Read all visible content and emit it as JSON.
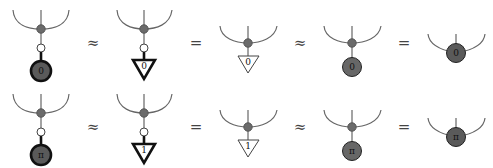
{
  "diagram": {
    "type": "zx-calculus-equations",
    "rows": [
      {
        "terms": [
          {
            "kind": "spider-with-thick-effect",
            "effect_label": "0"
          },
          {
            "kind": "spider-with-thick-triangle",
            "triangle_label": "0"
          },
          {
            "kind": "spider-with-triangle",
            "triangle_label": "0"
          },
          {
            "kind": "spider-with-dark-node",
            "node_label": "0"
          },
          {
            "kind": "fused-dark-spider",
            "node_label": "0"
          }
        ],
        "relations": [
          "≈",
          "=",
          "≈",
          "="
        ]
      },
      {
        "terms": [
          {
            "kind": "spider-with-thick-effect",
            "effect_label": "π"
          },
          {
            "kind": "spider-with-thick-triangle",
            "triangle_label": "1"
          },
          {
            "kind": "spider-with-triangle",
            "triangle_label": "1"
          },
          {
            "kind": "spider-with-dark-node",
            "node_label": "π"
          },
          {
            "kind": "fused-dark-spider",
            "node_label": "π"
          }
        ],
        "relations": [
          "≈",
          "=",
          "≈",
          "="
        ]
      }
    ],
    "colors": {
      "wire": "#666666",
      "grey_node": "#6b6b6b",
      "dark_node": "#5a5a5a",
      "thick_outline": "#111111"
    }
  }
}
